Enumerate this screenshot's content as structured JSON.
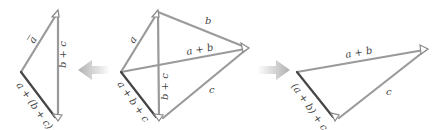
{
  "diagram": {
    "colors": {
      "vector_edge": "#9a9a9a",
      "resultant_edge": "#454545",
      "block_arrow": "#b8b8b8",
      "background": "#ffffff"
    },
    "panels": [
      {
        "id": "left",
        "description": "a + (b + c)",
        "vertices": {
          "top": [
            58,
            12
          ],
          "left": [
            21,
            72
          ],
          "bottom": [
            58,
            120
          ]
        },
        "edges": [
          {
            "name": "a",
            "label": "a⃗",
            "from": "left",
            "to": "top"
          },
          {
            "name": "b_plus_c",
            "label": "b⃗ + c⃗",
            "from": "top",
            "to": "bottom"
          },
          {
            "name": "resultant",
            "label": "a⃗ + (b⃗ + c⃗)",
            "from": "left",
            "to": "bottom"
          }
        ]
      },
      {
        "id": "center",
        "description": "a + b + c",
        "vertices": {
          "top": [
            158,
            12
          ],
          "right": [
            248,
            48
          ],
          "bottom": [
            160,
            120
          ],
          "left": [
            121,
            72
          ]
        },
        "edges": [
          {
            "name": "a",
            "label": "a⃗",
            "from": "left",
            "to": "top"
          },
          {
            "name": "b",
            "label": "b⃗",
            "from": "top",
            "to": "right"
          },
          {
            "name": "c",
            "label": "c⃗",
            "from": "right",
            "to": "bottom"
          },
          {
            "name": "a_plus_b",
            "label": "a⃗ + b⃗",
            "from": "left",
            "to": "right"
          },
          {
            "name": "b_plus_c",
            "label": "b⃗ + c⃗",
            "from": "top",
            "to": "bottom"
          },
          {
            "name": "resultant",
            "label": "a⃗ + b⃗ + c⃗",
            "from": "left",
            "to": "bottom"
          }
        ]
      },
      {
        "id": "right",
        "description": "(a + b) + c",
        "vertices": {
          "left": [
            297,
            72
          ],
          "right": [
            427,
            49
          ],
          "bottom": [
            336,
            120
          ]
        },
        "edges": [
          {
            "name": "a_plus_b",
            "label": "a⃗ + b⃗",
            "from": "left",
            "to": "right"
          },
          {
            "name": "c",
            "label": "c⃗",
            "from": "right",
            "to": "bottom"
          },
          {
            "name": "resultant",
            "label": "(a⃗ + b⃗) + c⃗",
            "from": "left",
            "to": "bottom"
          }
        ]
      }
    ],
    "arrows": [
      {
        "id": "to-left",
        "direction": "left",
        "x_from": 110,
        "x_to": 78,
        "y": 70
      },
      {
        "id": "to-right",
        "direction": "right",
        "x_from": 257,
        "x_to": 290,
        "y": 70
      }
    ],
    "labels": {
      "left_a": "a",
      "left_bc_b": "b",
      "left_bc_plus": "+",
      "left_bc_c": "c",
      "left_res": "a + (b + c)",
      "center_a": "a",
      "center_b": "b",
      "center_ab_a": "a",
      "center_ab_plus": "+",
      "center_ab_b": "b",
      "center_c": "c",
      "center_bc_b": "b",
      "center_bc_plus": "+",
      "center_bc_c": "c",
      "center_res": "a + b + c",
      "right_ab_a": "a",
      "right_ab_plus": "+",
      "right_ab_b": "b",
      "right_c": "c",
      "right_res": "(a + b) + c"
    }
  }
}
